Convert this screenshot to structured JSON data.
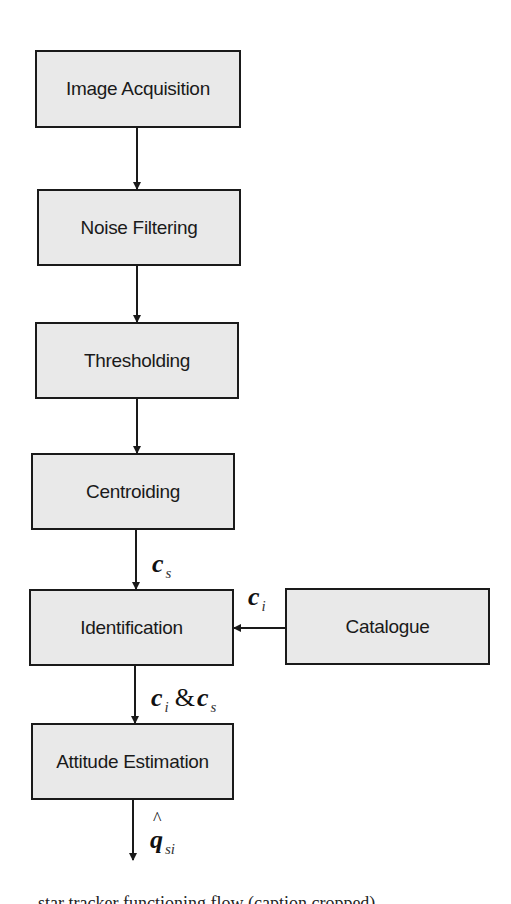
{
  "diagram": {
    "type": "flowchart",
    "nodes": [
      {
        "id": "image_acquisition",
        "label": "Image Acquisition"
      },
      {
        "id": "noise_filtering",
        "label": "Noise Filtering"
      },
      {
        "id": "thresholding",
        "label": "Thresholding"
      },
      {
        "id": "centroiding",
        "label": "Centroiding"
      },
      {
        "id": "identification",
        "label": "Identification"
      },
      {
        "id": "catalogue",
        "label": "Catalogue"
      },
      {
        "id": "attitude_estimation",
        "label": "Attitude Estimation"
      }
    ],
    "edges": [
      {
        "from": "image_acquisition",
        "to": "noise_filtering",
        "label": ""
      },
      {
        "from": "noise_filtering",
        "to": "thresholding",
        "label": ""
      },
      {
        "from": "thresholding",
        "to": "centroiding",
        "label": ""
      },
      {
        "from": "centroiding",
        "to": "identification",
        "label": "c_s"
      },
      {
        "from": "catalogue",
        "to": "identification",
        "label": "c_i"
      },
      {
        "from": "identification",
        "to": "attitude_estimation",
        "label": "c_i & c_s"
      },
      {
        "from": "attitude_estimation",
        "to": "output",
        "label": "q̂_si"
      }
    ],
    "labels": {
      "cs": {
        "main": "c",
        "sub": "s"
      },
      "ci": {
        "main": "c",
        "sub": "i"
      },
      "ci_cs": {
        "main1": "c",
        "sub1": "i",
        "amp": "&",
        "main2": "c",
        "sub2": "s"
      },
      "q_hat": {
        "main": "q",
        "sub": "si"
      }
    },
    "colors": {
      "box_fill": "#e9e9e9",
      "stroke": "#1a1a1a"
    }
  },
  "caption": "... star tracker functioning flow (caption cropped)"
}
